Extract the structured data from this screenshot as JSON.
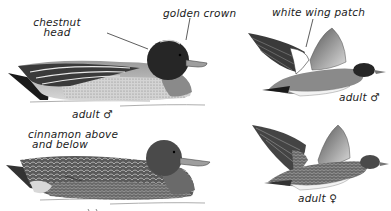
{
  "plate": {
    "subject": "Eurasian Wigeon",
    "figures": [
      {
        "id": "male-swimming",
        "pose": "swimming",
        "caption": "adult ♂",
        "annotations": [
          {
            "text_line1": "chestnut",
            "text_line2": "head"
          },
          {
            "text_line1": "golden crown"
          }
        ]
      },
      {
        "id": "male-flying",
        "pose": "flying",
        "caption": "adult ♂",
        "annotations": [
          {
            "text_line1": "white wing patch"
          }
        ]
      },
      {
        "id": "female-swimming",
        "pose": "swimming",
        "caption": "",
        "annotations": [
          {
            "text_line1": "cinnamon above",
            "text_line2": "and below"
          }
        ]
      },
      {
        "id": "female-flying",
        "pose": "flying",
        "caption": "adult ♀",
        "annotations": []
      }
    ]
  },
  "colors": {
    "ink": "#1a1a1a",
    "dark": "#2a2a2a",
    "mid": "#777777",
    "light": "#bdbdbd",
    "paper": "#ffffff"
  }
}
